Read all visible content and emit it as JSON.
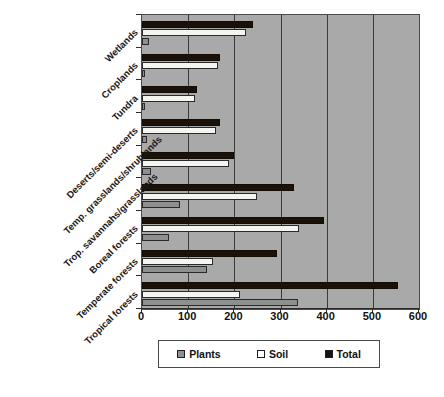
{
  "chart_data": {
    "type": "bar",
    "orientation": "horizontal",
    "title": "",
    "xlabel": "",
    "ylabel": "",
    "xlim": [
      0,
      600
    ],
    "xticks": [
      0,
      100,
      200,
      300,
      400,
      500,
      600
    ],
    "grid": true,
    "legend_position": "bottom",
    "categories": [
      "Tropical forests",
      "Temperate forests",
      "Boreal forests",
      "Trop. savannahs/grasslands",
      "Temp. grasslands/shrublands",
      "Deserts/semi-deserts",
      "Tundra",
      "Croplands",
      "Wetlands"
    ],
    "series": [
      {
        "name": "Plants",
        "color": "#8f8f8f",
        "values": [
          337,
          140,
          58,
          82,
          20,
          10,
          7,
          3,
          15
        ]
      },
      {
        "name": "Soil",
        "color": "#ffffff",
        "values": [
          213,
          153,
          340,
          250,
          188,
          160,
          115,
          165,
          225
        ]
      },
      {
        "name": "Total",
        "color": "#141414",
        "values": [
          555,
          292,
          395,
          330,
          200,
          170,
          120,
          170,
          240
        ]
      }
    ]
  },
  "legend": {
    "items": [
      {
        "label": "Plants",
        "swatch": "plants-swatch"
      },
      {
        "label": "Soil",
        "swatch": "soil-swatch"
      },
      {
        "label": "Total",
        "swatch": "total-swatch"
      }
    ]
  },
  "axis": {
    "tick_labels": [
      "0",
      "100",
      "200",
      "300",
      "400",
      "500",
      "600"
    ]
  }
}
